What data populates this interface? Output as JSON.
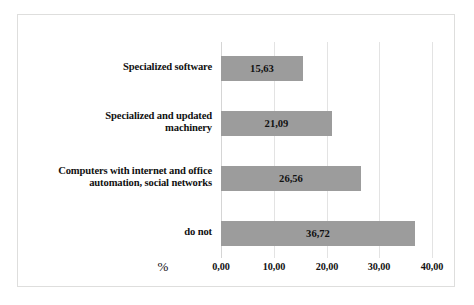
{
  "chart_data": {
    "type": "bar",
    "orientation": "horizontal",
    "title": "",
    "subtitle": "",
    "xlabel": "%",
    "ylabel": "",
    "categories": [
      "Specialized software",
      "Specialized and updated machinery",
      "Computers with internet and office automation, social networks",
      "do not"
    ],
    "values": [
      15.63,
      21.09,
      26.56,
      36.72
    ],
    "value_labels": [
      "15,63",
      "21,09",
      "26,56",
      "36,72"
    ],
    "xlim": [
      0,
      40
    ],
    "xticks": [
      0,
      10,
      20,
      30,
      40
    ],
    "xtick_labels": [
      "0,00",
      "10,00",
      "20,00",
      "30,00",
      "40,00"
    ],
    "grid": true,
    "grid_axis": "x",
    "legend": false,
    "legend_position": "none",
    "bar_color": "#9c9c9c",
    "background_color": "#ffffff",
    "border_color": "#dededd",
    "gridline_color": "#e3e3e3",
    "text_color": "#111111"
  },
  "rows": [
    {
      "label_line1": "Specialized software",
      "label_line2": "",
      "value_label": "15,63",
      "value": 15.63
    },
    {
      "label_line1": "Specialized and updated",
      "label_line2": "machinery",
      "value_label": "21,09",
      "value": 21.09
    },
    {
      "label_line1": "Computers with internet and office",
      "label_line2": "automation, social networks",
      "value_label": "26,56",
      "value": 26.56
    },
    {
      "label_line1": "do not",
      "label_line2": "",
      "value_label": "36,72",
      "value": 36.72
    }
  ],
  "axis": {
    "unit_label": "%",
    "ticks": [
      "0,00",
      "10,00",
      "20,00",
      "30,00",
      "40,00"
    ]
  }
}
